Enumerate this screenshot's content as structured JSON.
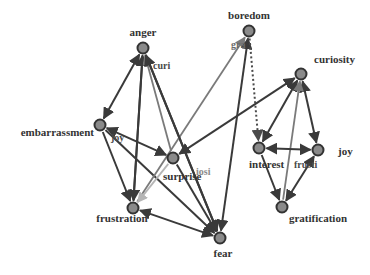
{
  "diagram": {
    "type": "directed-graph",
    "colors": {
      "node_fill": "#8a8a8a",
      "node_stroke": "#333333",
      "edge_dark": "#3a3a3a",
      "edge_mid": "#7a7a7a",
      "edge_light": "#b5b5b5",
      "label": "#333333"
    },
    "nodes": [
      {
        "id": "anger",
        "label": "anger",
        "x": 143,
        "y": 48,
        "lx": 143,
        "ly": 36,
        "anchor": "middle"
      },
      {
        "id": "boredom",
        "label": "boredom",
        "x": 249,
        "y": 31,
        "lx": 249,
        "ly": 19,
        "anchor": "middle"
      },
      {
        "id": "curiosity",
        "label": "curiosity",
        "x": 301,
        "y": 74,
        "lx": 314,
        "ly": 63,
        "anchor": "start"
      },
      {
        "id": "embarrassment",
        "label": "embarrassment",
        "x": 100,
        "y": 125,
        "lx": 94,
        "ly": 136,
        "anchor": "end"
      },
      {
        "id": "surprise",
        "label": "surprise",
        "x": 173,
        "y": 158,
        "lx": 163,
        "ly": 180,
        "anchor": "start"
      },
      {
        "id": "interest",
        "label": "interest",
        "x": 259,
        "y": 148,
        "lx": 249,
        "ly": 168,
        "anchor": "start"
      },
      {
        "id": "joy",
        "label": "joy",
        "x": 318,
        "y": 150,
        "lx": 338,
        "ly": 155,
        "anchor": "start"
      },
      {
        "id": "frustration",
        "label": "frustration",
        "x": 133,
        "y": 208,
        "lx": 122,
        "ly": 222,
        "anchor": "middle"
      },
      {
        "id": "gratification",
        "label": "gratification",
        "x": 282,
        "y": 207,
        "lx": 318,
        "ly": 222,
        "anchor": "middle"
      },
      {
        "id": "fear",
        "label": "fear",
        "x": 220,
        "y": 238,
        "lx": 223,
        "ly": 257,
        "anchor": "middle"
      }
    ],
    "edge_labels": [
      {
        "text": "curi",
        "x": 153,
        "y": 69,
        "color": "#4a4a4a"
      },
      {
        "text": "gra",
        "x": 231,
        "y": 48,
        "color": "#6a6a6a"
      },
      {
        "text": "joy",
        "x": 111,
        "y": 141,
        "color": "#4a4a4a"
      },
      {
        "text": "iosi",
        "x": 196,
        "y": 175,
        "color": "#8a8a8a"
      },
      {
        "text": "frusti",
        "x": 294,
        "y": 168,
        "color": "#4a4a4a"
      }
    ],
    "edges": [
      {
        "from": "anger",
        "to": "embarrassment",
        "style": "dark",
        "bidirectional": true
      },
      {
        "from": "frustration",
        "to": "anger",
        "style": "dark"
      },
      {
        "from": "surprise",
        "to": "anger",
        "style": "mid"
      },
      {
        "from": "fear",
        "to": "anger",
        "style": "dark"
      },
      {
        "from": "anger",
        "to": "frustration",
        "style": "dark"
      },
      {
        "from": "embarrassment",
        "to": "surprise",
        "style": "dark",
        "bidirectional": true
      },
      {
        "from": "embarrassment",
        "to": "frustration",
        "style": "dark"
      },
      {
        "from": "embarrassment",
        "to": "fear",
        "style": "dark"
      },
      {
        "from": "surprise",
        "to": "curiosity",
        "style": "dark",
        "bidirectional": true
      },
      {
        "from": "frustration",
        "to": "boredom",
        "style": "mid"
      },
      {
        "from": "surprise",
        "to": "frustration",
        "style": "light"
      },
      {
        "from": "surprise",
        "to": "fear",
        "style": "dark"
      },
      {
        "from": "fear",
        "to": "boredom",
        "style": "dark",
        "bidirectional": true
      },
      {
        "from": "boredom",
        "to": "interest",
        "style": "dotted"
      },
      {
        "from": "curiosity",
        "to": "interest",
        "style": "dark",
        "bidirectional": true
      },
      {
        "from": "curiosity",
        "to": "joy",
        "style": "dark",
        "bidirectional": true
      },
      {
        "from": "gratification",
        "to": "curiosity",
        "style": "mid"
      },
      {
        "from": "interest",
        "to": "joy",
        "style": "dark",
        "bidirectional": true
      },
      {
        "from": "interest",
        "to": "gratification",
        "style": "dark"
      },
      {
        "from": "joy",
        "to": "gratification",
        "style": "dark",
        "bidirectional": true
      },
      {
        "from": "fear",
        "to": "frustration",
        "style": "dark",
        "bidirectional": true
      },
      {
        "from": "anger",
        "to": "fear",
        "style": "dark"
      }
    ]
  }
}
